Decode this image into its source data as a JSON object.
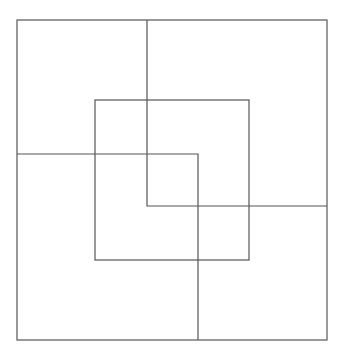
{
  "diagram": {
    "width": 349,
    "height": 361,
    "background": "#ffffff",
    "stroke_color": "#555555",
    "stroke_width": 1.2,
    "rects": [
      {
        "id": "outer-square",
        "x": 17,
        "y": 20,
        "w": 310,
        "h": 320
      },
      {
        "id": "middle-square",
        "x": 95,
        "y": 100,
        "w": 154,
        "h": 160
      }
    ],
    "polylines": [
      {
        "id": "top-right-L",
        "points": [
          [
            147,
            20
          ],
          [
            147,
            206
          ],
          [
            327,
            206
          ]
        ]
      },
      {
        "id": "bottom-left-L",
        "points": [
          [
            17,
            154
          ],
          [
            198,
            154
          ],
          [
            198,
            340
          ]
        ]
      }
    ]
  }
}
